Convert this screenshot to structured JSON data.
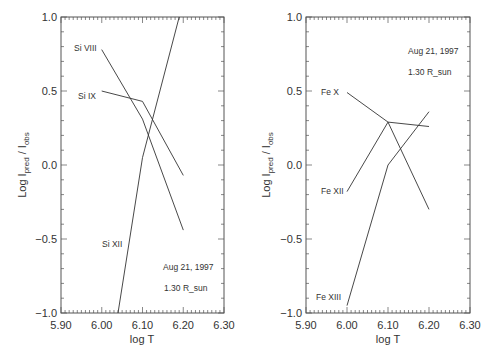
{
  "chart_data": [
    {
      "type": "line",
      "panel": "left",
      "title": "",
      "xlabel": "log T",
      "ylabel": "Log I_pred / I_obs",
      "xlim": [
        5.9,
        6.3
      ],
      "ylim": [
        -1.0,
        1.0
      ],
      "x_ticks": [
        "5.90",
        "6.00",
        "6.10",
        "6.20",
        "6.30"
      ],
      "y_ticks": [
        "-1.0",
        "-0.5",
        "0.0",
        "0.5",
        "1.0"
      ],
      "grid": false,
      "annotations": [
        "Aug 21, 1997",
        "1.30 R_sun"
      ],
      "series": [
        {
          "name": "Si VIII",
          "x": [
            6.0,
            6.1,
            6.2
          ],
          "y": [
            0.78,
            0.31,
            -0.44
          ]
        },
        {
          "name": "Si IX",
          "x": [
            6.0,
            6.1,
            6.2
          ],
          "y": [
            0.5,
            0.43,
            -0.07
          ]
        },
        {
          "name": "Si XII",
          "x": [
            6.04,
            6.1,
            6.19
          ],
          "y": [
            -1.0,
            0.05,
            1.0
          ]
        }
      ]
    },
    {
      "type": "line",
      "panel": "right",
      "title": "",
      "xlabel": "log T",
      "ylabel": "Log I_pred / I_obs",
      "xlim": [
        5.9,
        6.3
      ],
      "ylim": [
        -1.0,
        1.0
      ],
      "x_ticks": [
        "5.90",
        "6.00",
        "6.10",
        "6.20",
        "6.30"
      ],
      "y_ticks": [
        "-1.0",
        "-0.5",
        "0.0",
        "0.5",
        "1.0"
      ],
      "grid": false,
      "annotations": [
        "Aug 21, 1997",
        "1.30 R_sun"
      ],
      "series": [
        {
          "name": "Fe X",
          "x": [
            6.0,
            6.1,
            6.2
          ],
          "y": [
            0.49,
            0.29,
            0.26
          ]
        },
        {
          "name": "Fe XII",
          "x": [
            6.0,
            6.1,
            6.2
          ],
          "y": [
            -0.18,
            0.29,
            -0.3
          ]
        },
        {
          "name": "Fe XIII",
          "x": [
            6.0,
            6.1,
            6.2
          ],
          "y": [
            -0.95,
            0.0,
            0.36
          ]
        }
      ]
    }
  ],
  "panels": {
    "left": {
      "xlabel": "log T",
      "ylabel_main": "Log I",
      "ylabel_sub1": "pred",
      "ylabel_sep": " / I",
      "ylabel_sub2": "obs",
      "date": "Aug 21, 1997",
      "radius": "1.30 R_sun",
      "labels": {
        "s0": "Si VIII",
        "s1": "Si IX",
        "s2": "Si XII"
      }
    },
    "right": {
      "xlabel": "log T",
      "ylabel_main": "Log I",
      "ylabel_sub1": "pred",
      "ylabel_sep": " / I",
      "ylabel_sub2": "obs",
      "date": "Aug 21, 1997",
      "radius": "1.30 R_sun",
      "labels": {
        "s0": "Fe X",
        "s1": "Fe XII",
        "s2": "Fe XIII"
      }
    }
  },
  "style": {
    "line_color": "#333333",
    "axis_color": "#555555"
  }
}
